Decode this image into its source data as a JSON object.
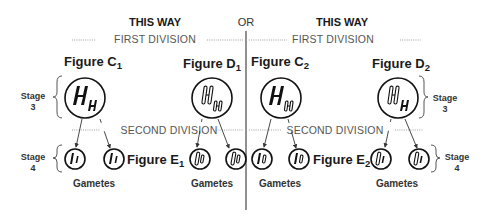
{
  "header": {
    "left_title": "THIS WAY",
    "separator": "OR",
    "right_title": "THIS WAY"
  },
  "divisions": {
    "first_left": "FIRST DIVISION",
    "first_right": "FIRST DIVISION",
    "second_left": "SECOND DIVISION",
    "second_right": "SECOND DIVISION"
  },
  "figures": {
    "c1": {
      "label": "Figure C",
      "sub": "1"
    },
    "d1": {
      "label": "Figure D",
      "sub": "1"
    },
    "c2": {
      "label": "Figure C",
      "sub": "2"
    },
    "d2": {
      "label": "Figure D",
      "sub": "2"
    },
    "e1": {
      "label": "Figure E",
      "sub": "1"
    },
    "e2": {
      "label": "Figure E",
      "sub": "2"
    }
  },
  "stages": {
    "left_stage3": {
      "word": "Stage",
      "num": "3"
    },
    "left_stage4": {
      "word": "Stage",
      "num": "4"
    },
    "right_stage3": {
      "word": "Stage",
      "num": "3"
    },
    "right_stage4": {
      "word": "Stage",
      "num": "4"
    }
  },
  "gametes": {
    "g1": "Gametes",
    "g2": "Gametes",
    "g3": "Gametes",
    "g4": "Gametes"
  },
  "cells": {
    "c1": {
      "chromosomes": [
        "H (solid, large)",
        "H (solid, small)"
      ]
    },
    "d1": {
      "chromosomes": [
        "H (outlined, large)",
        "H (outlined, small)"
      ]
    },
    "c2": {
      "chromosomes": [
        "H (solid, large)",
        "H (outlined, small)"
      ]
    },
    "d2": {
      "chromosomes": [
        "H (outlined, large)",
        "H (solid, small)"
      ]
    }
  }
}
